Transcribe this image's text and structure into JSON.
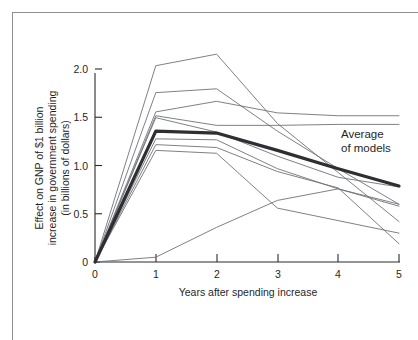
{
  "figure": {
    "annotation_label": "Average of models",
    "annotation_line1": "Average",
    "annotation_line2": "of models"
  },
  "axes": {
    "x_title": "Years after spending increase",
    "y_title_line1": "Effect on GNP of $1 billion",
    "y_title_line2": "increase in government spending",
    "y_title_line3": "(in billions of dollars)",
    "x_ticks": [
      "0",
      "1",
      "2",
      "3",
      "4",
      "5"
    ],
    "y_ticks": [
      "0",
      "0.5",
      "1.0",
      "1.5",
      "2.0"
    ]
  },
  "colors": {
    "model_line": "#6e7277",
    "average_line": "#2f2f33",
    "axis": "#2b2b2b",
    "frame": "#8c8f94",
    "background": "#ffffff"
  },
  "chart_data": {
    "type": "line",
    "title": "",
    "subtitle": "",
    "xlabel": "Years after spending increase",
    "ylabel": "Effect on GNP of $1 billion increase in government spending (in billions of dollars)",
    "x": [
      0,
      1,
      2,
      3,
      4,
      5
    ],
    "xlim": [
      0,
      5
    ],
    "ylim": [
      0,
      2.25
    ],
    "xticks": [
      0,
      1,
      2,
      3,
      4,
      5
    ],
    "yticks": [
      0,
      0.5,
      1.0,
      1.5,
      2.0
    ],
    "grid": false,
    "legend": "none",
    "annotations": [
      {
        "text": "Average of models",
        "x": 4.05,
        "y": 1.13
      }
    ],
    "series": [
      {
        "name": "Model 1",
        "values": [
          0.0,
          2.04,
          2.16,
          1.44,
          0.93,
          0.42
        ],
        "style": "thin",
        "color": "#6e7277"
      },
      {
        "name": "Model 2",
        "values": [
          0.0,
          1.76,
          1.8,
          1.36,
          0.97,
          0.6
        ],
        "style": "thin",
        "color": "#6e7277"
      },
      {
        "name": "Model 3",
        "values": [
          0.0,
          1.56,
          1.67,
          1.55,
          1.52,
          1.52
        ],
        "style": "thin",
        "color": "#6e7277"
      },
      {
        "name": "Model 4",
        "values": [
          0.0,
          1.52,
          1.42,
          1.42,
          1.43,
          1.43
        ],
        "style": "thin",
        "color": "#6e7277"
      },
      {
        "name": "Model 5",
        "values": [
          0.0,
          1.5,
          1.35,
          1.1,
          0.88,
          0.78
        ],
        "style": "thin",
        "color": "#6e7277"
      },
      {
        "name": "Model 6",
        "values": [
          0.0,
          1.22,
          1.19,
          0.94,
          0.77,
          0.19
        ],
        "style": "thin",
        "color": "#6e7277"
      },
      {
        "name": "Model 7",
        "values": [
          0.0,
          1.16,
          1.13,
          0.56,
          0.43,
          0.3
        ],
        "style": "thin",
        "color": "#6e7277"
      },
      {
        "name": "Model 8",
        "values": [
          0.0,
          1.28,
          1.27,
          0.97,
          0.76,
          0.58
        ],
        "style": "thin",
        "color": "#6e7277"
      },
      {
        "name": "Model 9",
        "values": [
          0.0,
          0.05,
          0.36,
          0.64,
          0.76,
          0.6
        ],
        "style": "thin",
        "color": "#6e7277"
      },
      {
        "name": "Average of models",
        "values": [
          0.0,
          1.36,
          1.34,
          1.16,
          0.97,
          0.79
        ],
        "style": "thick",
        "color": "#2f2f33"
      }
    ]
  }
}
